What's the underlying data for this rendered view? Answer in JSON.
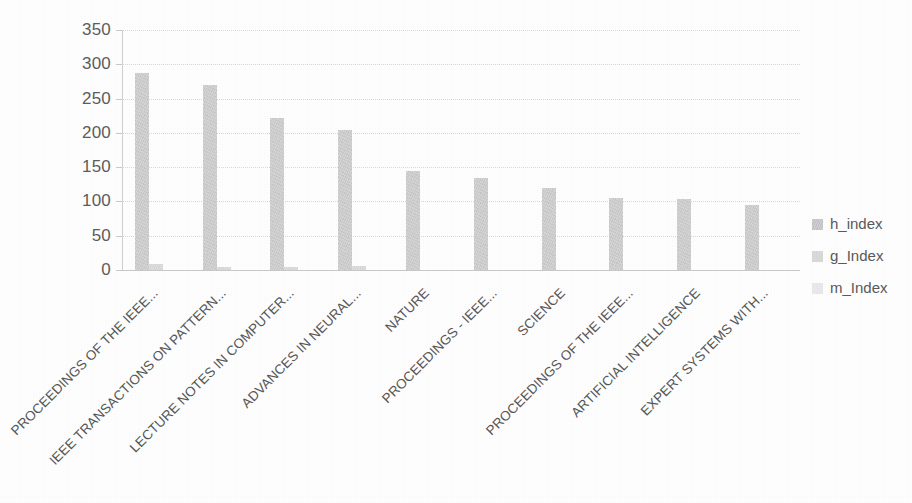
{
  "chart_data": {
    "type": "bar",
    "title": "",
    "subtitle": "",
    "xlabel": "",
    "ylabel": "",
    "ylim": [
      0,
      350
    ],
    "ytick_labels": [
      "350",
      "300",
      "250",
      "200",
      "150",
      "100",
      "50",
      "0"
    ],
    "ytick_values": [
      350,
      300,
      250,
      200,
      150,
      100,
      50,
      0
    ],
    "grid": true,
    "legend_position": "right",
    "categories": [
      "PROCEEDINGS OF THE IEEE...",
      "IEEE TRANSACTIONS ON PATTERN...",
      "LECTURE NOTES IN COMPUTER...",
      "ADVANCES IN NEURAL...",
      "NATURE",
      "PROCEEDINGS - IEEE...",
      "SCIENCE",
      "PROCEEDINGS OF THE IEEE...",
      "ARTIFICIAL INTELLIGENCE",
      "EXPERT SYSTEMS WITH..."
    ],
    "series": [
      {
        "name": "h_index",
        "color": "#d2d2d2",
        "values": [
          288,
          270,
          221,
          204,
          145,
          134,
          119,
          105,
          103,
          95
        ]
      },
      {
        "name": "g_Index",
        "color": "#dddddd",
        "values": [
          9,
          4,
          4,
          6,
          0,
          0,
          0,
          0,
          0,
          0
        ]
      },
      {
        "name": "m_Index",
        "color": "#ececec",
        "values": [
          0,
          0,
          0,
          0,
          0,
          0,
          0,
          0,
          0,
          0
        ]
      }
    ]
  },
  "legend": {
    "items": [
      {
        "label": "h_index"
      },
      {
        "label": "g_Index"
      },
      {
        "label": "m_Index"
      }
    ]
  },
  "icons": {
    "legend_marker": "square-swatch-icon"
  }
}
